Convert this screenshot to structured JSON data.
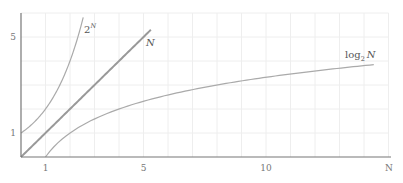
{
  "chart_data": {
    "type": "line",
    "title": "",
    "xlabel": "N",
    "ylabel": "",
    "xlim": [
      0,
      15
    ],
    "ylim": [
      0,
      6
    ],
    "grid": true,
    "grid_step": 1,
    "legend_position": "inline labels at curve ends",
    "x_ticks": [
      {
        "value": 1,
        "label": "1"
      },
      {
        "value": 5,
        "label": "5"
      },
      {
        "value": 10,
        "label": "10"
      }
    ],
    "y_ticks": [
      {
        "value": 1,
        "label": "1"
      },
      {
        "value": 5,
        "label": "5"
      }
    ],
    "series": [
      {
        "name": "2^N",
        "label_base": "2",
        "label_sup": "N",
        "function": "2^x",
        "x_range": [
          0,
          2.54
        ],
        "color": "#aaaaaa",
        "width": 1.2,
        "points": [
          [
            0,
            1
          ],
          [
            0.5,
            1.41
          ],
          [
            1,
            2
          ],
          [
            1.5,
            2.83
          ],
          [
            2,
            4
          ],
          [
            2.54,
            5.82
          ]
        ]
      },
      {
        "name": "N",
        "label_base": "N",
        "label_sup": "",
        "function": "x",
        "x_range": [
          0,
          5.3
        ],
        "color": "#999999",
        "width": 2,
        "points": [
          [
            0,
            0
          ],
          [
            5.3,
            5.3
          ]
        ]
      },
      {
        "name": "log2 N",
        "label_base": "log",
        "label_sub": "2",
        "label_var": "N",
        "function": "log2(x)",
        "x_range": [
          1,
          14.4
        ],
        "color": "#aaaaaa",
        "width": 1.2,
        "points": [
          [
            1,
            0
          ],
          [
            2,
            1
          ],
          [
            4,
            2
          ],
          [
            8,
            3
          ],
          [
            14.4,
            3.85
          ]
        ]
      }
    ]
  },
  "axes": {
    "x_axis_label": "N",
    "axis_color": "#777777",
    "grid_color": "#eeeeee"
  }
}
